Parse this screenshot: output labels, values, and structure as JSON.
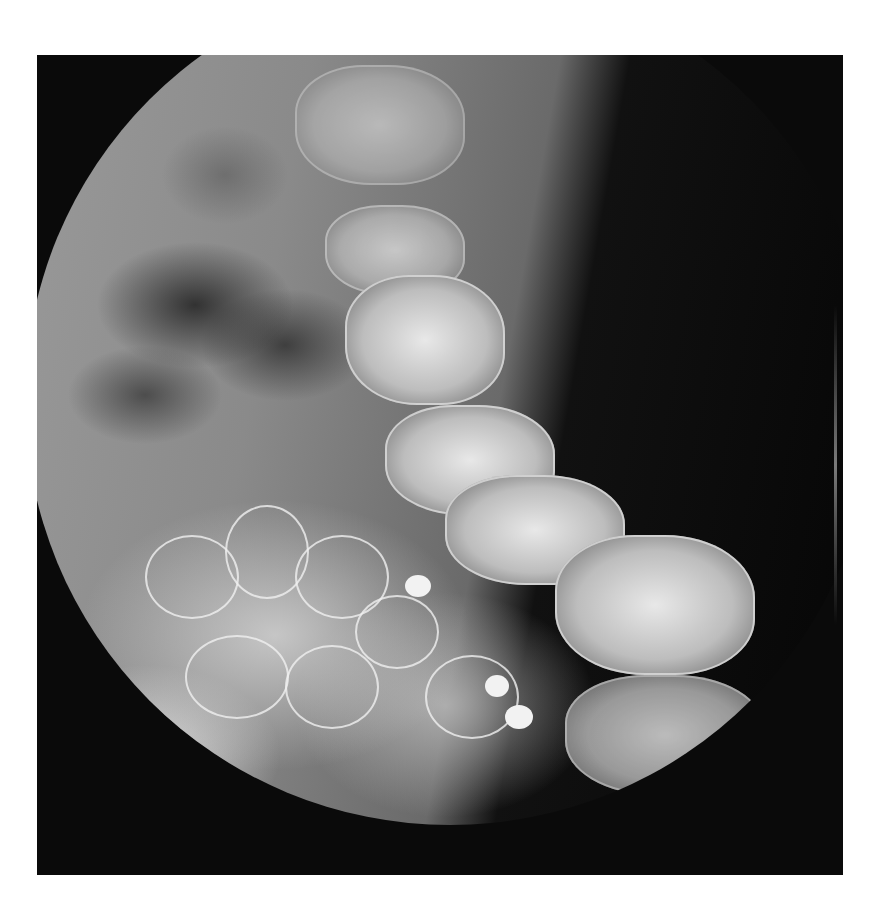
{
  "image": {
    "type": "radiograph",
    "description": "Circular-field fluoroscopic X-ray image on black background showing lumbar spine and contrast-filled bowel loops",
    "frame_color": "#0a0a0a",
    "page_background": "#ffffff"
  }
}
